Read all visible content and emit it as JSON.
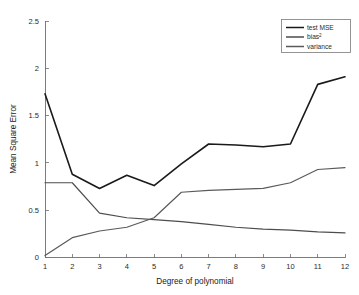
{
  "chart_data": {
    "type": "line",
    "title": "",
    "xlabel": "Degree of polynomial",
    "ylabel": "Mean Square Error",
    "x": [
      1,
      2,
      3,
      4,
      5,
      6,
      7,
      8,
      9,
      10,
      11,
      12
    ],
    "xticklabels": [
      "1",
      "2",
      "3",
      "4",
      "5",
      "6",
      "7",
      "8",
      "9",
      "10",
      "11",
      "12"
    ],
    "yticks": [
      0,
      0.5,
      1,
      1.5,
      2,
      2.5
    ],
    "yticklabels": [
      "0",
      "0.5",
      "1",
      "1.5",
      "2",
      "2.5"
    ],
    "xlim": [
      1,
      12
    ],
    "ylim": [
      0,
      2.5
    ],
    "grid": false,
    "legend_position": "top-right",
    "series": [
      {
        "name": "test MSE",
        "label_base": "test MSE",
        "label_sup": "",
        "color": "#1a1a1a",
        "width": 1.6,
        "values": [
          1.73,
          0.88,
          0.73,
          0.87,
          0.76,
          0.99,
          1.2,
          1.19,
          1.17,
          1.2,
          1.83,
          1.91
        ]
      },
      {
        "name": "bias2",
        "label_base": "bias",
        "label_sup": "2",
        "color": "#4d4d4d",
        "width": 1.2,
        "values": [
          0.79,
          0.79,
          0.47,
          0.42,
          0.4,
          0.38,
          0.35,
          0.32,
          0.3,
          0.29,
          0.27,
          0.26
        ]
      },
      {
        "name": "variance",
        "label_base": "variance",
        "label_sup": "",
        "color": "#5a5a5a",
        "width": 1.2,
        "values": [
          0.02,
          0.21,
          0.28,
          0.32,
          0.42,
          0.69,
          0.71,
          0.72,
          0.73,
          0.79,
          0.93,
          0.95
        ]
      }
    ]
  },
  "axes": {
    "ylabel": "Mean Square Error",
    "xlabel": "Degree of polynomial"
  }
}
